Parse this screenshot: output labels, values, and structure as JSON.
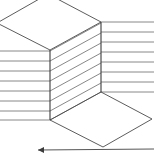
{
  "figure": {
    "type": "line-drawing",
    "background_color": "#ffffff",
    "stroke_color": "#4a4a4a",
    "rule_color": "#7a7a7a",
    "edge_color": "#3c3c3c",
    "canvas": {
      "width": 154,
      "height": 159
    }
  },
  "geometry": {
    "top_face": {
      "name": "top-diamond",
      "points": "48,-6 101,22 50,50 -3,23"
    },
    "bottom_face": {
      "name": "bottom-diamond",
      "points": "101,92 152,119 103,147 50,120"
    },
    "front_face": {
      "name": "center-parallelogram",
      "points": "50,50 101,22 101,92 50,120"
    },
    "left_edge": {
      "x": 50,
      "y1": 50,
      "y2": 120
    },
    "right_edge": {
      "x": 101,
      "y1": 22,
      "y2": 92
    },
    "left_rules": [
      {
        "x1": -2,
        "y1": 51,
        "x2": 50,
        "y2": 51
      },
      {
        "x1": -2,
        "y1": 61,
        "x2": 50,
        "y2": 61
      },
      {
        "x1": -2,
        "y1": 71,
        "x2": 50,
        "y2": 71
      },
      {
        "x1": -2,
        "y1": 81,
        "x2": 50,
        "y2": 81
      },
      {
        "x1": -2,
        "y1": 91,
        "x2": 50,
        "y2": 91
      },
      {
        "x1": -2,
        "y1": 101,
        "x2": 50,
        "y2": 101
      },
      {
        "x1": -2,
        "y1": 111,
        "x2": 50,
        "y2": 111
      },
      {
        "x1": -2,
        "y1": 120,
        "x2": 50,
        "y2": 120
      }
    ],
    "right_rules": [
      {
        "x1": 101,
        "y1": 22,
        "x2": 156,
        "y2": 22
      },
      {
        "x1": 101,
        "y1": 32,
        "x2": 156,
        "y2": 32
      },
      {
        "x1": 101,
        "y1": 42,
        "x2": 156,
        "y2": 42
      },
      {
        "x1": 101,
        "y1": 52,
        "x2": 156,
        "y2": 52
      },
      {
        "x1": 101,
        "y1": 62,
        "x2": 156,
        "y2": 62
      },
      {
        "x1": 101,
        "y1": 72,
        "x2": 156,
        "y2": 72
      },
      {
        "x1": 101,
        "y1": 82,
        "x2": 156,
        "y2": 82
      },
      {
        "x1": 101,
        "y1": 92,
        "x2": 156,
        "y2": 92
      }
    ],
    "front_rules": [
      {
        "x1": 50,
        "y1": 51,
        "x2": 101,
        "y2": 23
      },
      {
        "x1": 50,
        "y1": 61,
        "x2": 101,
        "y2": 33
      },
      {
        "x1": 50,
        "y1": 71,
        "x2": 101,
        "y2": 43
      },
      {
        "x1": 50,
        "y1": 81,
        "x2": 101,
        "y2": 53
      },
      {
        "x1": 50,
        "y1": 91,
        "x2": 101,
        "y2": 63
      },
      {
        "x1": 50,
        "y1": 101,
        "x2": 101,
        "y2": 73
      },
      {
        "x1": 50,
        "y1": 111,
        "x2": 101,
        "y2": 83
      },
      {
        "x1": 50,
        "y1": 120,
        "x2": 101,
        "y2": 92
      }
    ],
    "axis_arrow": {
      "name": "bottom-arrow",
      "x1": 38,
      "y1": 150,
      "x2": 154,
      "y2": 149,
      "head": "38,150 44,147 44,153"
    }
  }
}
